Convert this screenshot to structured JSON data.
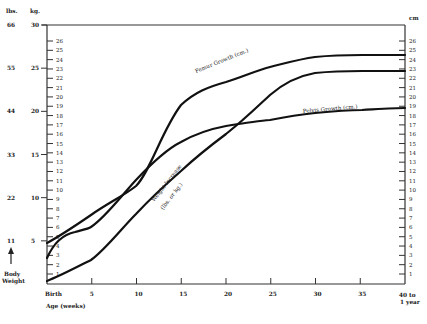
{
  "chart_data": {
    "type": "line",
    "title": "",
    "xlabel": "Age (weeks)",
    "ylabel_left": "Body Weight",
    "y_units_left": [
      "lbs.",
      "kg."
    ],
    "y_units_right": "cm",
    "x_ticks": [
      "Birth",
      "5",
      "10",
      "15",
      "20",
      "25",
      "30",
      "35",
      "40 to 1 year"
    ],
    "x": [
      0,
      5,
      10,
      15,
      20,
      25,
      30,
      35,
      40
    ],
    "xlim": [
      0,
      40
    ],
    "left_axis_kg_ticks": [
      "5",
      "10",
      "15",
      "20",
      "25",
      "30"
    ],
    "left_axis_lbs_ticks": [
      "11",
      "22",
      "33",
      "44",
      "55",
      "66"
    ],
    "cm_axis_ticks": [
      "1",
      "2",
      "3",
      "4",
      "5",
      "6",
      "7",
      "8",
      "9",
      "10",
      "11",
      "12",
      "13",
      "14",
      "15",
      "16",
      "17",
      "18",
      "19",
      "20",
      "21",
      "22",
      "23",
      "24",
      "25",
      "26"
    ],
    "ylim_kg": [
      0,
      30
    ],
    "ylim_cm": [
      0,
      27.5
    ],
    "grid": false,
    "series": [
      {
        "name": "Femur Growth (cm.)",
        "unit": "cm",
        "values": [
          4.3,
          7.6,
          10.4,
          19.1,
          21.5,
          23.1,
          24.1,
          24.4,
          24.4
        ]
      },
      {
        "name": "Pelvis Growth (cm.)",
        "unit": "cm",
        "values": [
          2.8,
          6.1,
          11.7,
          15.4,
          17.0,
          17.6,
          18.3,
          18.7,
          18.9
        ]
      },
      {
        "name": "Weight Increase (lbs. or kg.)",
        "unit": "kg",
        "values": [
          0.3,
          3.4,
          8.7,
          13.4,
          17.6,
          22.2,
          24.2,
          24.8,
          24.8
        ]
      }
    ]
  },
  "labels": {
    "lbs_header": "lbs.",
    "kg_header": "kg.",
    "cm_header": "cm",
    "body_weight_line1": "Body",
    "body_weight_line2": "Weight",
    "x_axis_title": "Age (weeks)",
    "x_last_line1": "40 to",
    "x_last_line2": "1 year",
    "femur_label": "Femur Growth (cm.)",
    "pelvis_label": "Pelvis Growth (cm.)",
    "weight_label_line1": "Weight Increase",
    "weight_label_line2": "(lbs. or kg.)"
  }
}
